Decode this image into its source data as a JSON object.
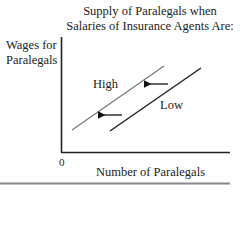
{
  "chart_data": {
    "type": "line",
    "title_lines": [
      "Supply of Paralegals when",
      "Salaries of Insurance Agents Are:"
    ],
    "xlabel": "Number of Paralegals",
    "ylabel": "Wages for Paralegals",
    "ylabel_lines": [
      "Wages for",
      "Paralegals"
    ],
    "origin_label": "0",
    "grid": false,
    "legend": "none",
    "series": [
      {
        "name": "High",
        "color": "#777777",
        "x": [
          72,
          164
        ],
        "y": [
          130,
          66
        ]
      },
      {
        "name": "Low",
        "color": "#222222",
        "x": [
          110,
          201
        ],
        "y": [
          131,
          68
        ]
      }
    ],
    "annotations": [
      {
        "type": "arrow",
        "direction": "left",
        "from": [
          168,
          84
        ],
        "to": [
          148,
          84
        ]
      },
      {
        "type": "arrow",
        "direction": "left",
        "from": [
          122,
          115
        ],
        "to": [
          102,
          115
        ]
      }
    ]
  },
  "labels": {
    "high": "High",
    "low": "Low"
  }
}
